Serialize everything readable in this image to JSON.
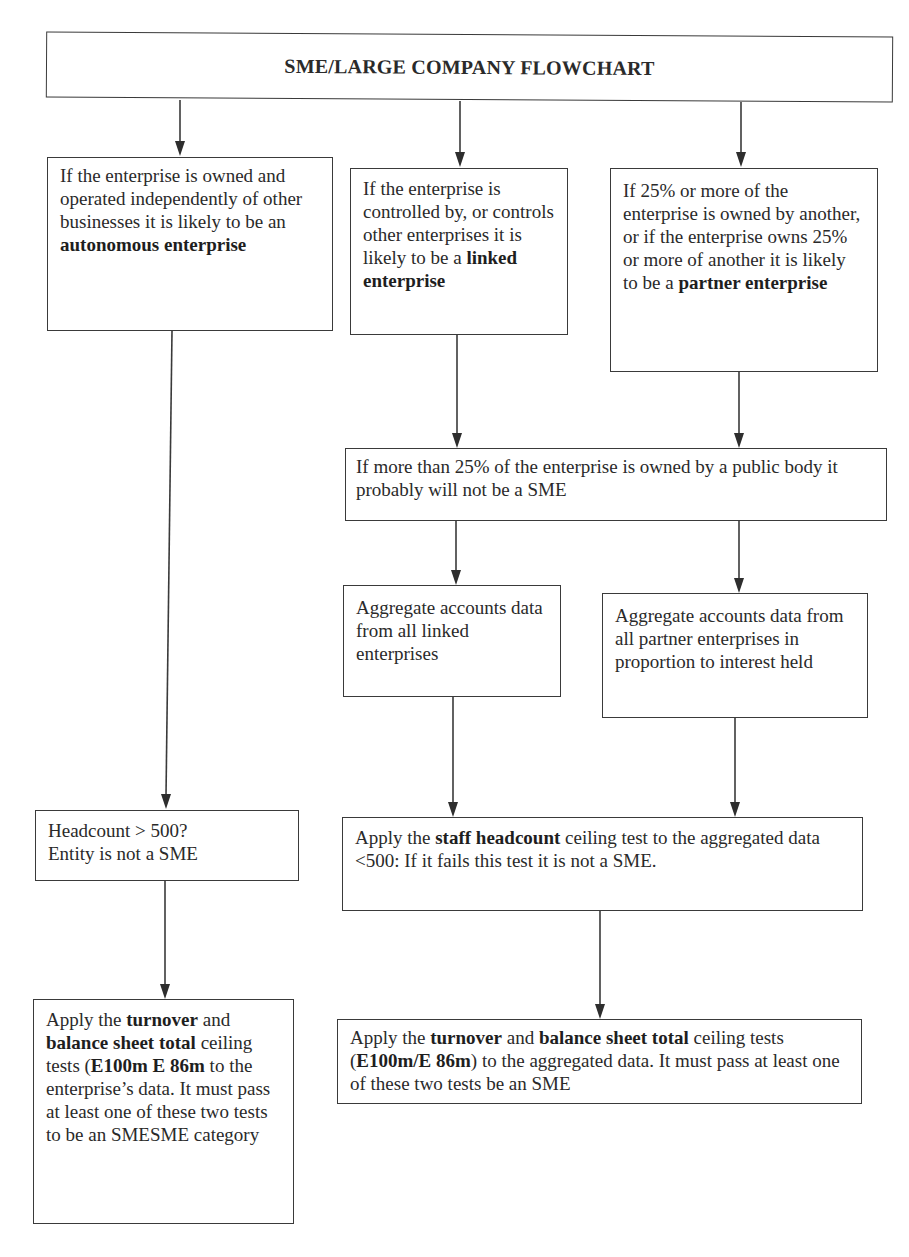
{
  "title": "SME/LARGE COMPANY FLOWCHART",
  "boxes": {
    "autonomous": {
      "parts": [
        {
          "text": "If the enterprise is owned and operated independently of other businesses it is likely to be an ",
          "bold": false
        },
        {
          "text": "autonomous enterprise",
          "bold": true
        }
      ]
    },
    "linked": {
      "parts": [
        {
          "text": "If the enterprise is controlled by, or controls other enterprises it is likely to be a ",
          "bold": false
        },
        {
          "text": "linked enterprise",
          "bold": true
        }
      ]
    },
    "partner": {
      "parts": [
        {
          "text": "If 25% or more of the enterprise is owned by another, or if the enterprise owns 25% or more of another it is likely to be a ",
          "bold": false
        },
        {
          "text": "partner enterprise",
          "bold": true
        }
      ]
    },
    "public_body": {
      "text": "If more than 25% of the enterprise is owned by a public body it probably will not be a SME"
    },
    "aggregate_linked": {
      "text": "Aggregate accounts data from all linked enterprises"
    },
    "aggregate_partner": {
      "text": "Aggregate accounts data from all partner enterprises in proportion to interest held"
    },
    "headcount_left": {
      "line1": "Headcount > 500?",
      "line2": "Entity is not a SME"
    },
    "staff_headcount": {
      "parts": [
        {
          "text": "Apply the ",
          "bold": false
        },
        {
          "text": "staff headcount",
          "bold": true
        },
        {
          "text": " ceiling test to the aggregated data <500: If it fails this test it is not a SME.",
          "bold": false
        }
      ]
    },
    "turnover_left": {
      "parts": [
        {
          "text": "Apply the ",
          "bold": false
        },
        {
          "text": "turnover",
          "bold": true
        },
        {
          "text": " and ",
          "bold": false
        },
        {
          "text": "balance sheet total",
          "bold": true
        },
        {
          "text": " ceiling tests (",
          "bold": false
        },
        {
          "text": "E100m E 86m",
          "bold": true
        },
        {
          "text": " to the enterprise’s data.  It must pass at least one of these two tests to be an SMESME category",
          "bold": false
        }
      ]
    },
    "turnover_right": {
      "parts": [
        {
          "text": "Apply the ",
          "bold": false
        },
        {
          "text": "turnover",
          "bold": true
        },
        {
          "text": " and ",
          "bold": false
        },
        {
          "text": "balance sheet total",
          "bold": true
        },
        {
          "text": " ceiling tests (",
          "bold": false
        },
        {
          "text": "E100m/E 86m",
          "bold": true
        },
        {
          "text": ") to the aggregated data. It must pass at least one of these two tests be an SME",
          "bold": false
        }
      ]
    }
  },
  "colors": {
    "line": "#3a3a3a",
    "text": "#2a2a2a",
    "background": "#ffffff"
  }
}
